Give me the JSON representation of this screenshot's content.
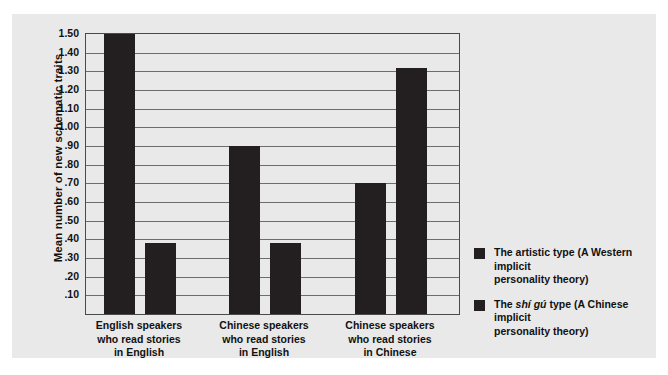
{
  "chart_data": {
    "type": "bar",
    "title": "",
    "xlabel": "",
    "ylabel": "Mean number of new schematic traits",
    "ylim": [
      0,
      1.5
    ],
    "grid": true,
    "legend_position": "right",
    "categories": [
      "English speakers who read stories in English",
      "Chinese speakers who read stories in English",
      "Chinese speakers who read stories in Chinese"
    ],
    "category_lines": [
      [
        "English speakers",
        "who read stories",
        "in English"
      ],
      [
        "Chinese speakers",
        "who read stories",
        "in English"
      ],
      [
        "Chinese speakers",
        "who read stories",
        "in Chinese"
      ]
    ],
    "series": [
      {
        "name": "The artistic type (A Western implicit personality theory)",
        "values": [
          1.5,
          0.9,
          0.7
        ],
        "color": "#231f20"
      },
      {
        "name": "The shí gú type (A Chinese implicit personality theory)",
        "values": [
          0.38,
          0.38,
          1.32
        ],
        "color": "#231f20"
      }
    ],
    "y_ticks": [
      {
        "value": 1.5,
        "label": "1.50"
      },
      {
        "value": 1.4,
        "label": "1.40"
      },
      {
        "value": 1.3,
        "label": "1.30"
      },
      {
        "value": 1.2,
        "label": "1.20"
      },
      {
        "value": 1.1,
        "label": "1.10"
      },
      {
        "value": 1.0,
        "label": "1.00"
      },
      {
        "value": 0.9,
        "label": ".90"
      },
      {
        "value": 0.8,
        "label": ".80"
      },
      {
        "value": 0.7,
        "label": ".70"
      },
      {
        "value": 0.6,
        "label": ".60"
      },
      {
        "value": 0.5,
        "label": ".50"
      },
      {
        "value": 0.4,
        "label": ".40"
      },
      {
        "value": 0.3,
        "label": ".30"
      },
      {
        "value": 0.2,
        "label": ".20"
      },
      {
        "value": 0.1,
        "label": ".10"
      }
    ],
    "legend": [
      {
        "prefix": "The artistic type (A Western implicit",
        "italic": "",
        "suffix": "",
        "line2": "personality theory)",
        "full": "The artistic type (A Western implicit personality theory)"
      },
      {
        "prefix": "The ",
        "italic": "shí gú",
        "suffix": " type (A Chinese implicit",
        "line2": "personality theory)",
        "full": "The shí gú type (A Chinese implicit personality theory)"
      }
    ],
    "colors": {
      "bar": "#231f20",
      "background": "#e9e9e9",
      "gridline": "#6d6d6d",
      "axis": "#4a4a4a",
      "text": "#111111"
    }
  }
}
